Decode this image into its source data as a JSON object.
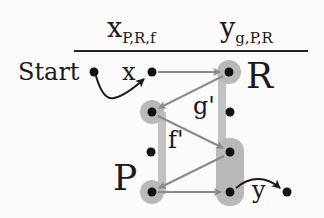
{
  "header": {
    "col1": {
      "base": "x",
      "sub": "P,R,f"
    },
    "col2": {
      "base": "y",
      "sub": "g,P,R"
    }
  },
  "labels": {
    "start": "Start",
    "x": "x",
    "R": "R",
    "P": "P",
    "g": "g'",
    "f": "f'",
    "y": "y"
  },
  "colors": {
    "node": "#111111",
    "halo": "#b9b9b9",
    "bar": "#c2c2c2",
    "edge": "#8a8a8a",
    "curve": "#1a1a1a",
    "rule": "#222222"
  },
  "nodes": [
    {
      "id": "start",
      "x": 94,
      "y": 72,
      "halo": false
    },
    {
      "id": "x",
      "x": 152,
      "y": 72,
      "halo": false
    },
    {
      "id": "R-top",
      "x": 229,
      "y": 72,
      "halo": true
    },
    {
      "id": "L1",
      "x": 152,
      "y": 112,
      "halo": true
    },
    {
      "id": "R1",
      "x": 230,
      "y": 112,
      "halo": false
    },
    {
      "id": "L2",
      "x": 151,
      "y": 152,
      "halo": false
    },
    {
      "id": "R2",
      "x": 230,
      "y": 152,
      "halo": true
    },
    {
      "id": "L3",
      "x": 152,
      "y": 192,
      "halo": true
    },
    {
      "id": "R3",
      "x": 230,
      "y": 192,
      "halo": true
    },
    {
      "id": "y-end",
      "x": 287,
      "y": 192,
      "halo": false
    }
  ],
  "edges": [
    {
      "from": "x",
      "to": "R-top",
      "label": ""
    },
    {
      "from": "R-top",
      "to": "L1",
      "label": "g'"
    },
    {
      "from": "L1",
      "to": "R2",
      "label": "f'"
    },
    {
      "from": "R2",
      "to": "L3",
      "label": ""
    },
    {
      "from": "L3",
      "to": "R3",
      "label": ""
    }
  ]
}
